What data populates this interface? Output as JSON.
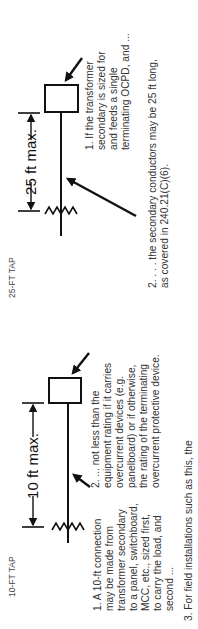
{
  "orientation": "rotated-90-ccw",
  "diagrams": [
    {
      "id": "25ft",
      "title": "25-FT TAP",
      "dimension_label": "25 ft max.",
      "notes": [
        {
          "number": "1.",
          "lines": [
            "1. If the transformer",
            "secondary is sized for",
            "and feeds a single",
            "terminating OCPD, and ..."
          ]
        },
        {
          "number": "2.",
          "lines": [
            "2. . . . the secondary conductors may be 25 ft long,",
            "as covered in 240.21(C)(6)."
          ]
        }
      ]
    },
    {
      "id": "10ft",
      "title": "10-FT TAP",
      "dimension_label": "10 ft max.",
      "notes": [
        {
          "number": "1.",
          "lines": [
            "1. A 10-ft connection",
            "may be made from",
            "transformer secondary",
            "to a panel, switchboard,",
            "MCC, etc., sized first,",
            "to carry the load, and",
            "second ..."
          ]
        },
        {
          "number": "2.",
          "lines": [
            "2. ... not less than the",
            "equipment rating if it carries",
            "overcurrent devices (e.g.",
            "panelboard) or if otherwise,",
            "the rating of the terminating",
            "overcurrent protective device."
          ]
        },
        {
          "number": "3.",
          "lines": [
            "3. For field installations such as this, the"
          ]
        }
      ]
    }
  ],
  "colors": {
    "ink": "#111111",
    "text": "#333333",
    "background": "#ffffff"
  }
}
